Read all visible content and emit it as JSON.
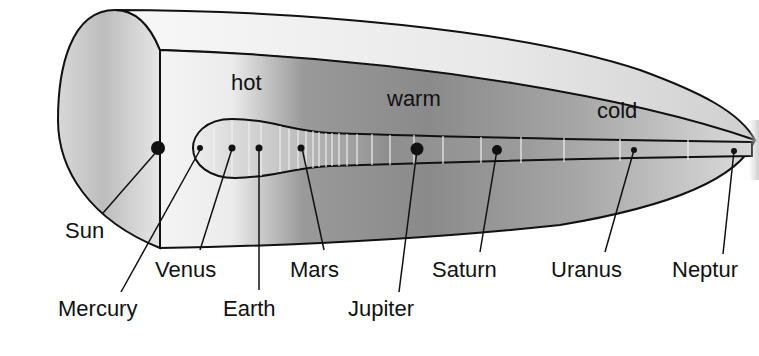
{
  "zones": {
    "hot": "hot",
    "warm": "warm",
    "cold": "cold"
  },
  "bodies": {
    "sun": "Sun",
    "mercury": "Mercury",
    "venus": "Venus",
    "earth": "Earth",
    "mars": "Mars",
    "jupiter": "Jupiter",
    "saturn": "Saturn",
    "uranus": "Uranus",
    "neptune": "Neptur"
  },
  "colors": {
    "outline": "#111111",
    "shell_light": "#f2f2f2",
    "shell_mid": "#cfcfcf",
    "inner_dark": "#8c8c8c",
    "tick": "#f4f4f4"
  }
}
